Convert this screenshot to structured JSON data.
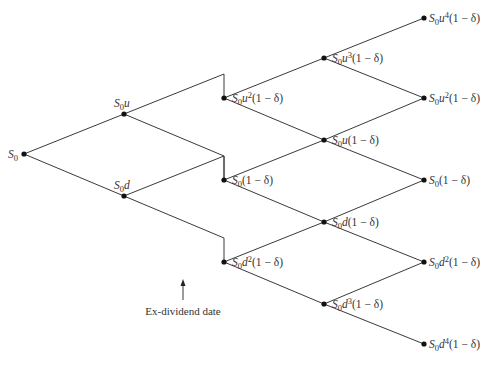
{
  "diagram": {
    "type": "binomial-tree",
    "nodes": [
      {
        "id": "n0",
        "x": 24,
        "y": 154,
        "label": {
          "base": "S",
          "sub": "0",
          "mid": "",
          "sup": "",
          "tail": ""
        },
        "label_pos": "left"
      },
      {
        "id": "n1u",
        "x": 124,
        "y": 114,
        "label": {
          "base": "S",
          "sub": "0",
          "mid": "u",
          "sup": "",
          "tail": ""
        },
        "label_pos": "above"
      },
      {
        "id": "n1d",
        "x": 124,
        "y": 196,
        "label": {
          "base": "S",
          "sub": "0",
          "mid": "d",
          "sup": "",
          "tail": ""
        },
        "label_pos": "above"
      },
      {
        "id": "n2a",
        "x": 224,
        "y": 98,
        "label": {
          "base": "S",
          "sub": "0",
          "mid": "u",
          "sup": "2",
          "tail": "(1 − δ)"
        },
        "label_pos": "right"
      },
      {
        "id": "n2b",
        "x": 224,
        "y": 180,
        "label": {
          "base": "S",
          "sub": "0",
          "mid": "",
          "sup": "",
          "tail": "(1 − δ)"
        },
        "label_pos": "right"
      },
      {
        "id": "n2c",
        "x": 224,
        "y": 262,
        "label": {
          "base": "S",
          "sub": "0",
          "mid": "d",
          "sup": "2",
          "tail": "(1 − δ)"
        },
        "label_pos": "right"
      },
      {
        "id": "n3a",
        "x": 324,
        "y": 58,
        "label": {
          "base": "S",
          "sub": "0",
          "mid": "u",
          "sup": "3",
          "tail": "(1 − δ)"
        },
        "label_pos": "right"
      },
      {
        "id": "n3b",
        "x": 324,
        "y": 140,
        "label": {
          "base": "S",
          "sub": "0",
          "mid": "u",
          "sup": "",
          "tail": "(1 − δ)"
        },
        "label_pos": "right"
      },
      {
        "id": "n3c",
        "x": 324,
        "y": 222,
        "label": {
          "base": "S",
          "sub": "0",
          "mid": "d",
          "sup": "",
          "tail": "(1 − δ)"
        },
        "label_pos": "right"
      },
      {
        "id": "n3d",
        "x": 324,
        "y": 304,
        "label": {
          "base": "S",
          "sub": "0",
          "mid": "d",
          "sup": "3",
          "tail": "(1 − δ)"
        },
        "label_pos": "right"
      },
      {
        "id": "n4a",
        "x": 424,
        "y": 18,
        "label": {
          "base": "S",
          "sub": "0",
          "mid": "u",
          "sup": "4",
          "tail": "(1 − δ)"
        },
        "label_pos": "right"
      },
      {
        "id": "n4b",
        "x": 424,
        "y": 98,
        "label": {
          "base": "S",
          "sub": "0",
          "mid": "u",
          "sup": "2",
          "tail": "(1 − δ)"
        },
        "label_pos": "right"
      },
      {
        "id": "n4c",
        "x": 424,
        "y": 180,
        "label": {
          "base": "S",
          "sub": "0",
          "mid": "",
          "sup": "",
          "tail": "(1 − δ)"
        },
        "label_pos": "right"
      },
      {
        "id": "n4d",
        "x": 424,
        "y": 262,
        "label": {
          "base": "S",
          "sub": "0",
          "mid": "d",
          "sup": "2",
          "tail": "(1 − δ)"
        },
        "label_pos": "right"
      },
      {
        "id": "n4e",
        "x": 424,
        "y": 344,
        "label": {
          "base": "S",
          "sub": "0",
          "mid": "d",
          "sup": "4",
          "tail": "(1 − δ)"
        },
        "label_pos": "right"
      }
    ],
    "edges": [
      [
        "n0",
        "n1u"
      ],
      [
        "n0",
        "n1d"
      ],
      [
        "n2a",
        "n3a"
      ],
      [
        "n2a",
        "n3b"
      ],
      [
        "n2b",
        "n3b"
      ],
      [
        "n2b",
        "n3c"
      ],
      [
        "n2c",
        "n3c"
      ],
      [
        "n2c",
        "n3d"
      ],
      [
        "n3a",
        "n4a"
      ],
      [
        "n3a",
        "n4b"
      ],
      [
        "n3b",
        "n4b"
      ],
      [
        "n3b",
        "n4c"
      ],
      [
        "n3c",
        "n4c"
      ],
      [
        "n3c",
        "n4d"
      ],
      [
        "n3d",
        "n4d"
      ],
      [
        "n3d",
        "n4e"
      ]
    ],
    "dividend_jumps": [
      {
        "from": "n1u",
        "corner": [
          224,
          74
        ],
        "to": "n2a"
      },
      {
        "from": "n1u",
        "corner": [
          224,
          156
        ],
        "to": "n2b"
      },
      {
        "from": "n1d",
        "corner": [
          224,
          156
        ],
        "to": "n2b"
      },
      {
        "from": "n1d",
        "corner": [
          224,
          238
        ],
        "to": "n2c"
      }
    ],
    "annotation": {
      "text": "Ex-dividend date",
      "arrow": {
        "x": 183,
        "y_from": 300,
        "y_to": 279
      },
      "text_x": 183,
      "text_y": 315
    }
  }
}
